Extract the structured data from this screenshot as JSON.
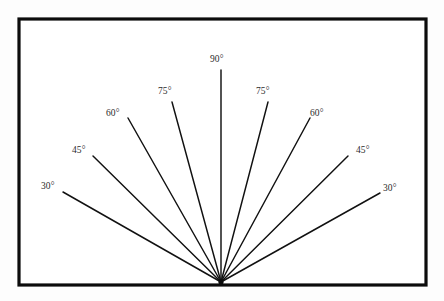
{
  "figure": {
    "background_color": "#fdfdfd",
    "panel_color": "#ffffff",
    "border_color": "#0c0c0c",
    "line_color": "#111111",
    "label_color": "#2b2b2b",
    "frame": {
      "x": 19,
      "y": 19,
      "width": 407,
      "height": 266
    },
    "apex": {
      "x": 221,
      "y": 282
    }
  },
  "chart_data": {
    "type": "line",
    "title": "",
    "xlabel": "",
    "ylabel": "",
    "apex": {
      "x": 221,
      "y": 282
    },
    "units": "degrees",
    "rays": [
      {
        "label": "30°",
        "angle": 30,
        "side": "left",
        "x2": 63,
        "y2": 192,
        "label_x": 41,
        "label_y": 182
      },
      {
        "label": "45°",
        "angle": 45,
        "side": "left",
        "x2": 93,
        "y2": 156,
        "label_x": 72,
        "label_y": 146
      },
      {
        "label": "60°",
        "angle": 60,
        "side": "left",
        "x2": 128,
        "y2": 118,
        "label_x": 106,
        "label_y": 109
      },
      {
        "label": "75°",
        "angle": 75,
        "side": "left",
        "x2": 172,
        "y2": 102,
        "label_x": 158,
        "label_y": 87
      },
      {
        "label": "90°",
        "angle": 90,
        "side": "center",
        "x2": 221,
        "y2": 70,
        "label_x": 210,
        "label_y": 55
      },
      {
        "label": "75°",
        "angle": 75,
        "side": "right",
        "x2": 268,
        "y2": 102,
        "label_x": 256,
        "label_y": 87
      },
      {
        "label": "60°",
        "angle": 60,
        "side": "right",
        "x2": 310,
        "y2": 118,
        "label_x": 310,
        "label_y": 109
      },
      {
        "label": "45°",
        "angle": 45,
        "side": "right",
        "x2": 348,
        "y2": 156,
        "label_x": 356,
        "label_y": 146
      },
      {
        "label": "30°",
        "angle": 30,
        "side": "right",
        "x2": 380,
        "y2": 193,
        "label_x": 383,
        "label_y": 184
      }
    ]
  }
}
